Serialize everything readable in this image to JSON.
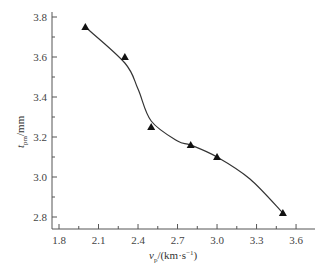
{
  "chart_data": {
    "type": "scatter",
    "title": "",
    "xlabel": "v_p/(km·s⁻¹)",
    "ylabel": "t_pm/mm",
    "xlim": [
      1.8,
      3.75
    ],
    "ylim": [
      2.75,
      3.8
    ],
    "x_ticks": [
      "1.8",
      "2.1",
      "2.4",
      "2.7",
      "3.0",
      "3.3",
      "3.6"
    ],
    "y_ticks": [
      "2.8",
      "3.0",
      "3.2",
      "3.4",
      "3.6",
      "3.8"
    ],
    "grid": false,
    "legend": null,
    "series": [
      {
        "name": "measured",
        "marker": "triangle",
        "x": [
          2.0,
          2.3,
          2.5,
          2.8,
          3.0,
          3.5
        ],
        "y": [
          3.75,
          3.6,
          3.25,
          3.16,
          3.1,
          2.82
        ]
      },
      {
        "name": "fitted curve",
        "style": "smooth-line",
        "x": [
          2.0,
          2.3,
          2.4,
          2.5,
          2.7,
          2.8,
          3.0,
          3.25,
          3.5
        ],
        "y": [
          3.75,
          3.57,
          3.44,
          3.28,
          3.18,
          3.16,
          3.1,
          2.99,
          2.82
        ]
      }
    ]
  },
  "axes": {
    "x_label_main": "v",
    "x_label_sub": "p",
    "x_label_unit": "/(km·s",
    "x_label_sup": "−1",
    "x_label_close": ")",
    "y_label_main": "t",
    "y_label_sub": "pm",
    "y_label_unit": "/mm"
  }
}
